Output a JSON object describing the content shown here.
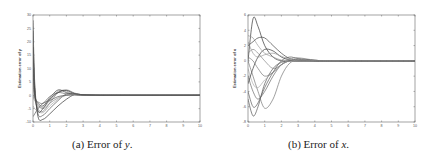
{
  "figure": {
    "captions": [
      {
        "prefix": "(a) Error of ",
        "var": "y",
        "suffix": "."
      },
      {
        "prefix": "(b) Error of ",
        "var": "x",
        "suffix": "."
      }
    ]
  },
  "chart_data": [
    {
      "type": "line",
      "title": "",
      "caption": "(a) Error of y.",
      "xlabel": "",
      "ylabel": "Estimation error of y",
      "xlim": [
        0,
        10
      ],
      "ylim": [
        -10,
        30
      ],
      "xticks": [
        0,
        1,
        2,
        3,
        4,
        5,
        6,
        7,
        8,
        9,
        10
      ],
      "yticks": [
        -10,
        -5,
        0,
        5,
        10,
        15,
        20,
        25,
        30
      ],
      "grid": false,
      "legend": null,
      "frame": {
        "left": 33,
        "top": 15,
        "right": 200,
        "bottom": 122
      },
      "series": [
        {
          "name": "trajectory 1",
          "x": [
            0,
            0.1,
            0.3,
            0.6,
            1.0,
            1.5,
            2.0,
            2.5,
            3.0,
            4.0,
            5.0,
            10
          ],
          "values": [
            28,
            5,
            -8,
            -9,
            -7,
            -4,
            -1.5,
            0.3,
            0.2,
            0,
            0,
            0
          ]
        },
        {
          "name": "trajectory 2",
          "x": [
            0,
            0.1,
            0.3,
            0.6,
            1.0,
            1.5,
            2.0,
            2.5,
            3.0,
            4.0,
            5.0,
            10
          ],
          "values": [
            24,
            3,
            -7,
            -7.5,
            -5,
            -2,
            0.5,
            0.5,
            0.2,
            0,
            0,
            0
          ]
        },
        {
          "name": "trajectory 3",
          "x": [
            0,
            0.1,
            0.3,
            0.6,
            1.0,
            1.5,
            2.0,
            2.5,
            3.0,
            4.0,
            5.0,
            10
          ],
          "values": [
            20,
            2,
            -5,
            -6,
            -3,
            1,
            2,
            0.8,
            0.2,
            0.1,
            0,
            0
          ]
        },
        {
          "name": "trajectory 4",
          "x": [
            0,
            0.1,
            0.3,
            0.6,
            1.0,
            1.5,
            2.0,
            2.5,
            3.0,
            4.0,
            5.0,
            10
          ],
          "values": [
            15,
            1,
            -4,
            -4.5,
            -2,
            1.5,
            1.5,
            0.5,
            0.1,
            0,
            0,
            0
          ]
        },
        {
          "name": "trajectory 5",
          "x": [
            0,
            0.1,
            0.3,
            0.6,
            1.0,
            1.5,
            2.0,
            2.5,
            3.0,
            4.0,
            5.0,
            10
          ],
          "values": [
            10,
            0,
            -3,
            -4,
            -1,
            2,
            1,
            0.3,
            0.1,
            0,
            0,
            0
          ]
        },
        {
          "name": "trajectory 6",
          "x": [
            0,
            0.1,
            0.3,
            0.6,
            1.0,
            1.5,
            2.0,
            2.5,
            3.0,
            4.0,
            5.0,
            10
          ],
          "values": [
            5,
            -1,
            -2.5,
            -3,
            -0.5,
            1,
            0.5,
            0.2,
            0.1,
            0,
            0,
            0
          ]
        },
        {
          "name": "trajectory 7",
          "x": [
            0,
            0.1,
            0.3,
            0.6,
            1.0,
            1.5,
            2.0,
            2.5,
            3.0,
            4.0,
            5.0,
            10
          ],
          "values": [
            0,
            -2,
            -3.5,
            -5,
            -3,
            -1,
            0,
            0.3,
            0.1,
            0,
            0,
            0
          ]
        },
        {
          "name": "trajectory 8",
          "x": [
            0,
            0.1,
            0.3,
            0.6,
            1.0,
            1.5,
            2.0,
            2.5,
            3.0,
            4.0,
            5.0,
            10
          ],
          "values": [
            -4,
            -5,
            -6,
            -6.5,
            -4,
            -1.5,
            0,
            0.2,
            0.1,
            0,
            0,
            0
          ]
        },
        {
          "name": "trajectory 9",
          "x": [
            0,
            0.1,
            0.3,
            0.6,
            1.0,
            1.5,
            2.0,
            2.5,
            3.0,
            4.0,
            5.0,
            10
          ],
          "values": [
            18,
            2,
            -6,
            -5,
            -1.5,
            1,
            1.8,
            0.6,
            0.2,
            0,
            0,
            0
          ]
        },
        {
          "name": "trajectory 10",
          "x": [
            0,
            0.1,
            0.3,
            0.6,
            1.0,
            1.5,
            2.0,
            2.5,
            3.0,
            4.0,
            5.0,
            10
          ],
          "values": [
            -8,
            -7,
            -5,
            -3,
            -2,
            -0.5,
            0,
            0.1,
            0,
            0,
            0,
            0
          ]
        }
      ]
    },
    {
      "type": "line",
      "title": "",
      "caption": "(b) Error of x.",
      "xlabel": "",
      "ylabel": "Estimation error of x",
      "xlim": [
        0,
        10
      ],
      "ylim": [
        -8,
        6
      ],
      "xticks": [
        0,
        1,
        2,
        3,
        4,
        5,
        6,
        7,
        8,
        9,
        10
      ],
      "yticks": [
        -8,
        -6,
        -4,
        -2,
        0,
        2,
        4,
        6
      ],
      "grid": false,
      "legend": null,
      "frame": {
        "left": 248,
        "top": 15,
        "right": 415,
        "bottom": 122
      },
      "series": [
        {
          "name": "trajectory 1",
          "x": [
            0,
            0.3,
            0.6,
            1.0,
            1.5,
            2.0,
            2.5,
            3.0,
            4.0,
            5.0,
            10
          ],
          "values": [
            0,
            5.5,
            4.5,
            2,
            0.5,
            0,
            0,
            0,
            0,
            0,
            0
          ]
        },
        {
          "name": "trajectory 2",
          "x": [
            0,
            0.3,
            0.6,
            1.0,
            1.5,
            2.0,
            2.5,
            3.0,
            4.0,
            5.0,
            10
          ],
          "values": [
            -5,
            -7.2,
            -6,
            -3,
            -1,
            -0.2,
            0,
            0,
            0,
            0,
            0
          ]
        },
        {
          "name": "trajectory 3",
          "x": [
            0,
            0.3,
            0.6,
            1.0,
            1.5,
            2.0,
            2.5,
            3.0,
            4.0,
            5.0,
            10
          ],
          "values": [
            0,
            -2,
            -4,
            -6.2,
            -5,
            -2,
            -0.3,
            0,
            0,
            0,
            0
          ]
        },
        {
          "name": "trajectory 4",
          "x": [
            0,
            0.3,
            0.6,
            1.0,
            1.5,
            2.0,
            2.5,
            3.0,
            4.0,
            5.0,
            10
          ],
          "values": [
            3.3,
            3,
            2,
            1,
            0.5,
            0.1,
            0,
            0,
            0,
            0,
            0
          ]
        },
        {
          "name": "trajectory 5",
          "x": [
            0,
            0.3,
            0.6,
            1.0,
            1.5,
            2.0,
            2.5,
            3.0,
            4.0,
            5.0,
            10
          ],
          "values": [
            2,
            2.5,
            3,
            3,
            2,
            1,
            0.3,
            0.1,
            0,
            0,
            0
          ]
        },
        {
          "name": "trajectory 6",
          "x": [
            0,
            0.3,
            0.6,
            1.0,
            1.5,
            2.0,
            2.5,
            3.0,
            4.0,
            5.0,
            10
          ],
          "values": [
            -2,
            -4,
            -5,
            -4,
            -2,
            -0.5,
            0,
            0.2,
            0,
            0,
            0
          ]
        },
        {
          "name": "trajectory 7",
          "x": [
            0,
            0.3,
            0.6,
            1.0,
            1.5,
            2.0,
            2.5,
            3.0,
            4.0,
            5.0,
            10
          ],
          "values": [
            1,
            1.5,
            1,
            0,
            -1,
            -0.5,
            0.2,
            0.4,
            0.1,
            0,
            0
          ]
        },
        {
          "name": "trajectory 8",
          "x": [
            0,
            0.3,
            0.6,
            1.0,
            1.5,
            2.0,
            2.5,
            3.0,
            4.0,
            5.0,
            10
          ],
          "values": [
            -1,
            -3,
            -3.5,
            -2.5,
            -1.5,
            -0.5,
            0,
            0,
            0,
            0,
            0
          ]
        },
        {
          "name": "trajectory 9",
          "x": [
            0,
            0.3,
            0.6,
            1.0,
            1.5,
            2.0,
            2.5,
            3.0,
            4.0,
            5.0,
            10
          ],
          "values": [
            -3,
            -1,
            0.5,
            1.5,
            1.3,
            0.5,
            0.1,
            0,
            0,
            0,
            0
          ]
        },
        {
          "name": "trajectory 10",
          "x": [
            0,
            0.3,
            0.6,
            1.0,
            1.5,
            2.0,
            2.5,
            3.0,
            4.0,
            5.0,
            10
          ],
          "values": [
            -4,
            -6,
            -5.5,
            -3.5,
            -1.5,
            0,
            0.5,
            0.3,
            0.1,
            0,
            0
          ]
        },
        {
          "name": "trajectory 11",
          "x": [
            0,
            0.3,
            0.6,
            1.0,
            1.5,
            2.0,
            2.5,
            3.0,
            4.0,
            5.0,
            10
          ],
          "values": [
            0.5,
            0,
            -1,
            -2,
            -1.5,
            -0.5,
            0,
            0,
            0,
            0,
            0
          ]
        },
        {
          "name": "trajectory 12",
          "x": [
            0,
            0.3,
            0.6,
            1.0,
            1.5,
            2.0,
            2.5,
            3.0,
            4.0,
            5.0,
            10
          ],
          "values": [
            2.5,
            1,
            0.5,
            0.8,
            1,
            0.6,
            0.2,
            0,
            0,
            0,
            0
          ]
        }
      ]
    }
  ]
}
